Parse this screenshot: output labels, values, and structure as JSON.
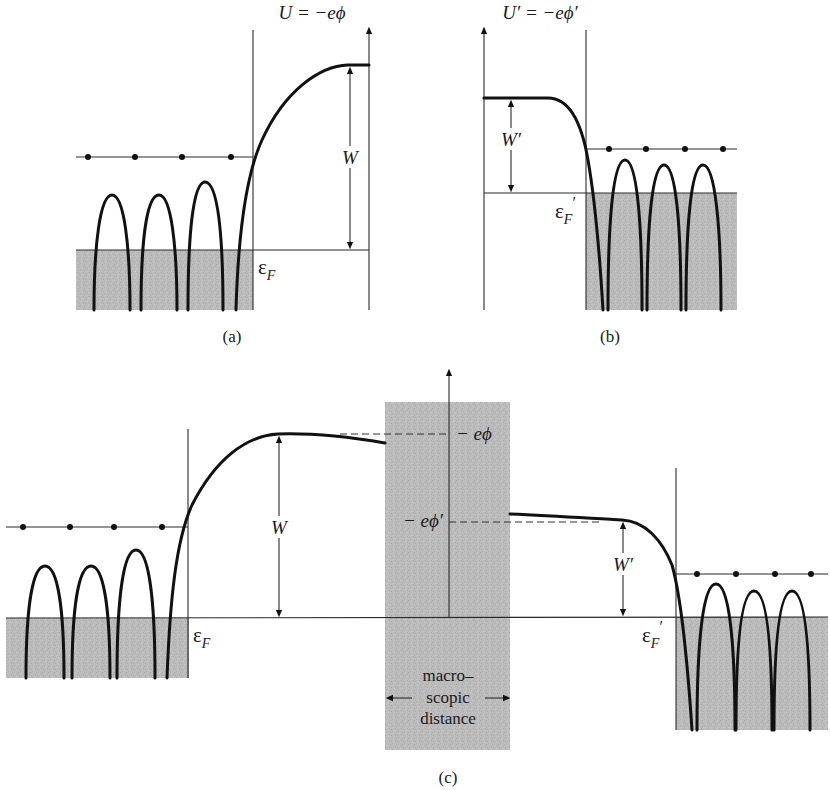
{
  "figure": {
    "panels": [
      {
        "id": "a",
        "caption": "(a)",
        "axis_label": "U = −eϕ",
        "barrier_label": "W",
        "fermi_label": "ε",
        "fermi_sub": "F",
        "ion_count": 3,
        "electron_dots": 4
      },
      {
        "id": "b",
        "caption": "(b)",
        "axis_label": "U′ = −eϕ′",
        "barrier_label": "W′",
        "fermi_label": "ε",
        "fermi_sub": "F",
        "fermi_prime": "′",
        "ion_count": 3,
        "electron_dots": 4
      },
      {
        "id": "c",
        "caption": "(c)",
        "left_barrier_label": "W",
        "right_barrier_label": "W′",
        "left_fermi_label": "ε",
        "left_fermi_sub": "F",
        "right_fermi_label": "ε",
        "right_fermi_sub": "F",
        "right_fermi_prime": "′",
        "level_phi": "− eϕ",
        "level_phi_prime": "− eϕ′",
        "gap_text_line1": "macro–",
        "gap_text_line2": "scopic",
        "gap_text_line3": "distance"
      }
    ],
    "colors": {
      "ink": "#111111",
      "shade": "#b9b9b9",
      "background": "#ffffff"
    }
  }
}
